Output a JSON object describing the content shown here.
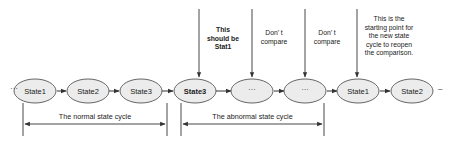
{
  "diagram": {
    "type": "state-sequence",
    "leading_ellipsis": "···",
    "trailing_ellipsis": "–",
    "nodes": [
      {
        "label": "State1",
        "bold": false
      },
      {
        "label": "State2",
        "bold": false
      },
      {
        "label": "State3",
        "bold": false
      },
      {
        "label": "State3",
        "bold": true
      },
      {
        "label": "···",
        "bold": false
      },
      {
        "label": "···",
        "bold": false
      },
      {
        "label": "State1",
        "bold": false
      },
      {
        "label": "State2",
        "bold": false
      }
    ],
    "annotations": [
      {
        "target_node": 3,
        "lines": [
          "This",
          "should be",
          "Stat1"
        ],
        "bold": true
      },
      {
        "target_node": 4,
        "lines": [
          "Don’ t",
          "compare"
        ],
        "bold": false
      },
      {
        "target_node": 5,
        "lines": [
          "Don’ t",
          "compare"
        ],
        "bold": false
      },
      {
        "target_node": 6,
        "lines": [
          "This is the",
          "starting point for",
          "the new state",
          "cycle to reopen",
          "the comparison."
        ],
        "bold": false
      }
    ],
    "spans": [
      {
        "label": "The normal state cycle",
        "from_node": 0,
        "to_node": 2
      },
      {
        "label": "The abnormal state cycle",
        "from_node": 3,
        "to_node": 5
      }
    ],
    "colors": {
      "node_fill": "#ececec",
      "node_stroke": "#555555",
      "line": "#333333",
      "text": "#222222",
      "background": "#ffffff"
    }
  }
}
